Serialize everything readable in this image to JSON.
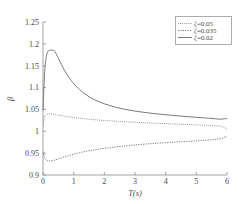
{
  "chart_data": {
    "type": "line",
    "title": "",
    "xlabel": "T(s)",
    "ylabel": "β",
    "xlim": [
      0,
      6
    ],
    "ylim": [
      0.9,
      1.25
    ],
    "xticks": [
      "0",
      "1",
      "2",
      "3",
      "4",
      "5",
      "6"
    ],
    "xtick_values": [
      0,
      1,
      2,
      3,
      4,
      5,
      6
    ],
    "yticks": [
      "0.9",
      "0.95",
      "1",
      "1.05",
      "1.1",
      "1.15",
      "1.2",
      "1.25"
    ],
    "ytick_values": [
      0.9,
      0.95,
      1.0,
      1.05,
      1.1,
      1.15,
      1.2,
      1.25
    ],
    "grid": false,
    "legend_position": "top-right",
    "x": [
      0,
      0.05,
      0.1,
      0.15,
      0.2,
      0.25,
      0.3,
      0.35,
      0.4,
      0.5,
      0.6,
      0.7,
      0.8,
      0.9,
      1.0,
      1.2,
      1.4,
      1.6,
      1.8,
      2.0,
      2.2,
      2.4,
      2.6,
      2.8,
      3.0,
      3.2,
      3.4,
      3.6,
      3.8,
      4.0,
      4.2,
      4.4,
      4.6,
      4.8,
      5.0,
      5.2,
      5.4,
      5.6,
      5.8,
      6.0
    ],
    "series": [
      {
        "name": "ζ=0.05",
        "style": "dotted",
        "values": [
          1.013,
          1.032,
          1.038,
          1.0395,
          1.0398,
          1.0397,
          1.0393,
          1.0388,
          1.0382,
          1.037,
          1.0358,
          1.0346,
          1.0335,
          1.0325,
          1.0315,
          1.0298,
          1.0283,
          1.027,
          1.0258,
          1.0247,
          1.0238,
          1.0229,
          1.0221,
          1.0213,
          1.0206,
          1.0199,
          1.0193,
          1.0187,
          1.0181,
          1.0175,
          1.017,
          1.0164,
          1.0158,
          1.0152,
          1.0146,
          1.0139,
          1.0132,
          1.0124,
          1.0115,
          1.0055
        ]
      },
      {
        "name": "ζ=0.035",
        "style": "dashdot",
        "values": [
          0.9535,
          0.9405,
          0.9345,
          0.9325,
          0.932,
          0.9322,
          0.9328,
          0.9336,
          0.9345,
          0.9368,
          0.9392,
          0.9415,
          0.9437,
          0.9457,
          0.9476,
          0.951,
          0.954,
          0.9566,
          0.9589,
          0.961,
          0.9629,
          0.9646,
          0.9661,
          0.9675,
          0.9688,
          0.97,
          0.9711,
          0.9721,
          0.973,
          0.9739,
          0.9748,
          0.9756,
          0.9764,
          0.9772,
          0.978,
          0.9789,
          0.98,
          0.9813,
          0.9832,
          0.9885
        ]
      },
      {
        "name": "ζ=0.02",
        "style": "solid",
        "values": [
          1.048,
          1.13,
          1.168,
          1.181,
          1.185,
          1.1855,
          1.1855,
          1.1852,
          1.1812,
          1.167,
          1.1525,
          1.1395,
          1.128,
          1.118,
          1.1092,
          1.0948,
          1.0838,
          1.0752,
          1.0684,
          1.0629,
          1.0584,
          1.0546,
          1.0514,
          1.0487,
          1.0463,
          1.0442,
          1.0424,
          1.0407,
          1.0392,
          1.0378,
          1.0365,
          1.0353,
          1.0342,
          1.0331,
          1.032,
          1.0309,
          1.0299,
          1.0288,
          1.0277,
          1.0295
        ]
      }
    ]
  },
  "legend": {
    "entries": [
      {
        "label": "ζ=0.05",
        "style": "dotted"
      },
      {
        "label": "ζ=0.035",
        "style": "dashdot"
      },
      {
        "label": "ζ=0.02",
        "style": "solid"
      }
    ]
  },
  "colors": {
    "axis": "#8a8a8a",
    "curve": "#6b6b6b",
    "text": "#4a4a4a",
    "background": "#ffffff"
  }
}
